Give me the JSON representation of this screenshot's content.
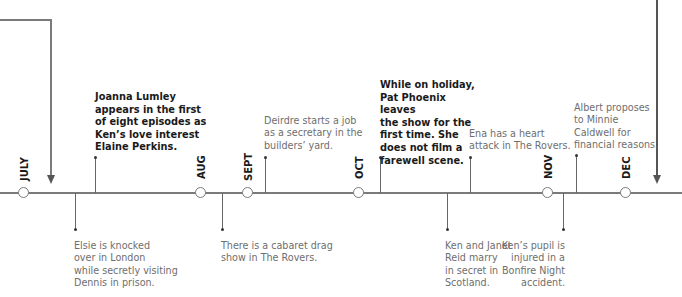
{
  "months": [
    {
      "label": "JULY",
      "x": 24
    },
    {
      "label": "AUG",
      "x": 201
    },
    {
      "label": "SEPT",
      "x": 248
    },
    {
      "label": "OCT",
      "x": 359
    },
    {
      "label": "NOV",
      "x": 548
    },
    {
      "label": "DEC",
      "x": 626
    }
  ],
  "events_above": [
    {
      "text_lines": [
        "Joanna Lumley",
        "appears in the first",
        "of eight episodes as",
        "Ken’s love interest",
        "Elaine Perkins."
      ],
      "bold": true
    },
    {
      "text_lines": [
        "Deirdre starts a job",
        "as a secretary in the",
        "builders’ yard."
      ],
      "bold": false
    },
    {
      "text_lines": [
        "While on holiday,",
        "Pat Phoenix leaves",
        "the show for the",
        "first time. She",
        "does not film a",
        "farewell scene."
      ],
      "bold": true
    },
    {
      "text_lines": [
        "Ena has a heart",
        "attack in The Rovers."
      ],
      "bold": false
    },
    {
      "text_lines": [
        "Albert proposes",
        "to Minnie",
        "Caldwell for",
        "financial reasons."
      ],
      "bold": false
    }
  ],
  "events_below": [
    {
      "text_lines": [
        "Elsie is knocked",
        "over in London",
        "while secretly visiting",
        "Dennis in prison."
      ]
    },
    {
      "text_lines": [
        "There is a cabaret drag",
        "show in The Rovers."
      ]
    },
    {
      "text_lines": [
        "Ken and Janet",
        "Reid marry",
        "in secret in",
        "Scotland."
      ]
    },
    {
      "text_lines": [
        "Ken’s pupil is",
        "injured in a",
        "Bonfire Night",
        "accident."
      ]
    }
  ],
  "text": {
    "e0": "Joanna Lumley\nappears in the first\nof eight episodes as\nKen’s love interest\nElaine Perkins.",
    "e1": "Deirdre starts a job\nas a secretary in the\nbuilders’ yard.",
    "e2": "While on holiday,\nPat Phoenix leaves\nthe show for the\nfirst time. She\ndoes not film a\nfarewell scene.",
    "e3": "Ena has a heart\nattack in The Rovers.",
    "e4": "Albert proposes\nto Minnie\nCaldwell for\nfinancial reasons.",
    "b0": "Elsie is knocked\nover in London\nwhile secretly visiting\nDennis in prison.",
    "b1": "There is a cabaret drag\nshow in The Rovers.",
    "b2": "Ken and Janet\nReid marry\nin secret in\nScotland.",
    "b3": "Ken’s pupil is\ninjured in a\nBonfire Night\naccident.",
    "m0": "JULY",
    "m1": "AUG",
    "m2": "SEPT",
    "m3": "OCT",
    "m4": "NOV",
    "m5": "DEC"
  },
  "colors": {
    "line": "#7a7a7a",
    "bold_text": "#1a1a1a",
    "light_text": "#6e6e6e"
  }
}
